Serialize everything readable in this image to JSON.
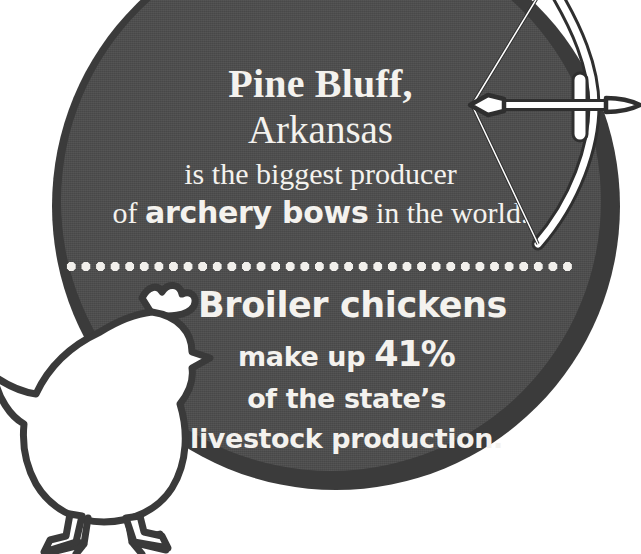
{
  "canvas": {
    "width": 641,
    "height": 554
  },
  "colors": {
    "background": "#ffffff",
    "badge_ring": "#3b3b3b",
    "badge_face": "#4d4d4d",
    "text": "#f4f2ee",
    "dot_divider": "#f2f0ec",
    "bow_fill": "#ffffff",
    "bow_outline": "#2f2f2f",
    "chicken_fill": "#ffffff",
    "chicken_outline": "#3a3a3a"
  },
  "badge": {
    "top_fact": {
      "city": "Pine Bluff,",
      "state": "Arkansas",
      "line_3": "is the biggest producer",
      "line_4_prefix": "of ",
      "line_4_emphasis": "archery bows",
      "line_4_suffix": " in the world."
    },
    "divider": {
      "style": "dotted",
      "dot_count": 35
    },
    "bottom_fact": {
      "headline": "Broiler chickens",
      "line_2_prefix": "make up ",
      "line_2_stat": "41%",
      "line_3": "of the state’s",
      "line_4": "livestock production."
    }
  },
  "graphics": {
    "bow": {
      "name": "archery-bow-icon",
      "description": "recurve bow with nocked arrow pointing right"
    },
    "chicken": {
      "name": "chicken-silhouette-icon",
      "description": "white broiler chicken silhouette facing right"
    }
  },
  "facts": {
    "archery_bows_rank": "biggest producer in the world",
    "broiler_chicken_share_percent": 41
  }
}
